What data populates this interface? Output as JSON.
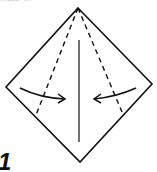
{
  "caption": "...ier. ...",
  "step_number": "1",
  "diagram": {
    "type": "origami-fold-instruction",
    "shape": "square-diamond",
    "vertices": {
      "top": [
        78,
        8
      ],
      "right": [
        152,
        84
      ],
      "bottom": [
        80,
        162
      ],
      "left": [
        6,
        87
      ]
    },
    "center_crease": {
      "from": [
        79,
        40
      ],
      "to": [
        79,
        142
      ]
    },
    "valley_folds": [
      {
        "from": [
          78,
          8
        ],
        "to": [
          36,
          115
        ]
      },
      {
        "from": [
          78,
          8
        ],
        "to": [
          122,
          112
        ]
      }
    ],
    "arrows": [
      {
        "direction": "right",
        "from": [
          20,
          88
        ],
        "to": [
          65,
          99
        ]
      },
      {
        "direction": "left",
        "from": [
          136,
          88
        ],
        "to": [
          94,
          99
        ]
      }
    ],
    "line_color": "#111111"
  }
}
